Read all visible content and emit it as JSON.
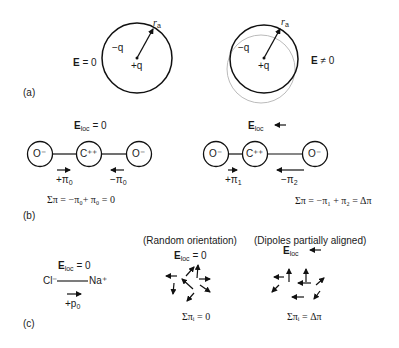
{
  "panel_a": {
    "label": "(a)",
    "left": {
      "field": "E",
      "field_eq": " = 0",
      "neg_charge": "−q",
      "pos_charge": "+q",
      "radius": "r",
      "radius_sub": "a"
    },
    "right": {
      "field": "E",
      "field_eq": " ≠ 0",
      "neg_charge": "−q",
      "pos_charge": "+q",
      "radius": "r",
      "radius_sub": "a"
    }
  },
  "panel_b": {
    "label": "(b)",
    "left": {
      "field": "E",
      "field_sub": "loc",
      "field_eq": " = 0",
      "atoms": [
        "O⁻",
        "C⁺⁺",
        "O⁻"
      ],
      "dipole_left": "+π",
      "dipole_left_sub": "0",
      "dipole_right": "−π",
      "dipole_right_sub": "0",
      "sum": "Σπ = −π₀+ π₀ = 0"
    },
    "right": {
      "field": "E",
      "field_sub": "loc",
      "atoms": [
        "O⁻",
        "C⁺⁺",
        "O⁻"
      ],
      "dipole_left": "+π",
      "dipole_left_sub": "1",
      "dipole_right": "−π",
      "dipole_right_sub": "2",
      "sum": "Σπ = −π₁ + π₂ = Δπ"
    }
  },
  "panel_c": {
    "label": "(c)",
    "ionic": {
      "field": "E",
      "field_sub": "loc",
      "field_eq": " = 0",
      "anion": "Cl⁻",
      "cation": "Na⁺",
      "dipole": "+p",
      "dipole_sub": "0"
    },
    "random": {
      "title": "(Random orientation)",
      "field": "E",
      "field_sub": "loc",
      "field_eq": " = 0",
      "sum": "Σπᵢ = 0",
      "sum_top": "i",
      "sum_bottom": "0"
    },
    "aligned": {
      "title": "(Dipoles partially aligned)",
      "field": "E",
      "field_sub": "loc",
      "sum": "Σπᵢ = Δπ",
      "sum_top": "i",
      "sum_bottom": "0"
    }
  }
}
